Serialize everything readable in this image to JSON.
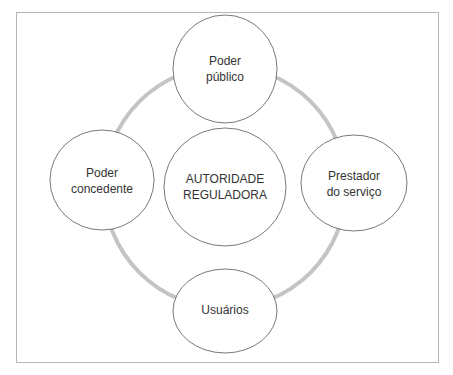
{
  "diagram": {
    "colors": {
      "ring": "#c4c4c4",
      "node_border": "#555555",
      "frame": "#b5b5b5",
      "text": "#333333"
    },
    "center": {
      "line1": "AUTORIDADE",
      "line2": "REGULADORA"
    },
    "nodes": {
      "top": {
        "line1": "Poder",
        "line2": "público"
      },
      "left": {
        "line1": "Poder",
        "line2": "concedente"
      },
      "right": {
        "line1": "Prestador",
        "line2": "do serviço"
      },
      "bottom": {
        "line1": "Usuários"
      }
    }
  }
}
